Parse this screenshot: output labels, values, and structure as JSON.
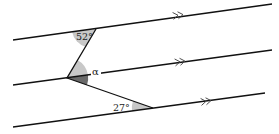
{
  "diagram": {
    "type": "parallel-lines-angles",
    "colors": {
      "line": "#111111",
      "angle_fill_light": "#c8c8c8",
      "angle_fill_dark": "#6a6a6a"
    },
    "parallel_lines": [
      {
        "id": "line-1",
        "x1": 13,
        "y1": 40,
        "x2": 272,
        "y2": 4,
        "arrow_x": 180,
        "arrow_y": 15
      },
      {
        "id": "line-2",
        "x1": 13,
        "y1": 85,
        "x2": 272,
        "y2": 50,
        "arrow_x": 182,
        "arrow_y": 62
      },
      {
        "id": "line-3",
        "x1": 13,
        "y1": 127,
        "x2": 265,
        "y2": 93,
        "arrow_x": 208,
        "arrow_y": 101
      }
    ],
    "transversal": {
      "points": [
        [
          96,
          29
        ],
        [
          67,
          78
        ],
        [
          153,
          108
        ]
      ]
    },
    "angles": {
      "top": {
        "label": "52°"
      },
      "alpha": {
        "label": "α"
      },
      "bottom": {
        "label": "27°"
      }
    }
  }
}
